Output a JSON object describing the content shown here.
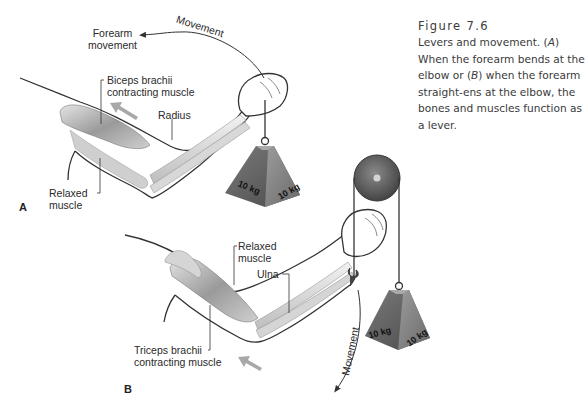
{
  "figure": {
    "number": "Figure 7.6",
    "caption_parts": [
      "Levers and movement. (",
      "A",
      ") When the forearm bends at the elbow or (",
      "B",
      ") when the forearm straight-ens at the elbow, the bones and muscles function as a lever."
    ]
  },
  "panel_a": {
    "letter": "A",
    "labels": {
      "forearm_movement_1": "Forearm",
      "forearm_movement_2": "movement",
      "movement_arc": "Movement",
      "biceps_1": "Biceps brachii",
      "biceps_2": "contracting muscle",
      "radius": "Radius",
      "relaxed_1": "Relaxed",
      "relaxed_2": "muscle"
    },
    "weight": {
      "face_left": "10 kg",
      "face_right": "10 kg"
    }
  },
  "panel_b": {
    "letter": "B",
    "labels": {
      "relaxed_1": "Relaxed",
      "relaxed_2": "muscle",
      "ulna": "Ulna",
      "triceps_1": "Triceps brachii",
      "triceps_2": "contracting muscle",
      "movement_arc": "Movement"
    },
    "weight": {
      "face_left": "10 kg",
      "face_right": "10 kg"
    }
  },
  "colors": {
    "outline": "#333333",
    "muscle_dark": "#8c8c8c",
    "muscle_light": "#d4d4d4",
    "weight_dark": "#5a5a5a",
    "weight_light": "#9a9a9a",
    "arrow_gray": "#a8a8a8"
  }
}
